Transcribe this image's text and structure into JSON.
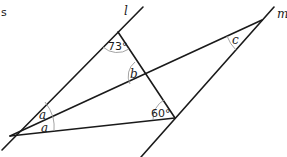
{
  "caption_fragment": "s",
  "lines": {
    "l": {
      "label": "l"
    },
    "m": {
      "label": "m"
    }
  },
  "angles": {
    "top": "73°",
    "bottom_right": "60°",
    "intersection": "b",
    "far_right": "c",
    "left_upper": "a",
    "left_lower": "a"
  },
  "colors": {
    "line": "#1a1a1a",
    "arc": "#9a9a9a",
    "background": "#ffffff"
  }
}
